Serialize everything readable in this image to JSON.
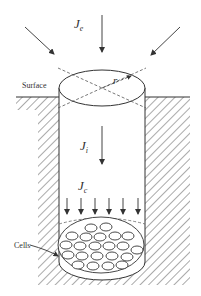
{
  "diagram": {
    "labels": {
      "je_main": "J",
      "je_sub": "e",
      "ji_main": "J",
      "ji_sub": "i",
      "jc_main": "J",
      "jc_sub": "c",
      "radius": "r",
      "surface": "Surface",
      "cells": "Cells"
    },
    "colors": {
      "stroke": "#333333",
      "hatch": "#555555",
      "background": "#ffffff"
    },
    "counts": {
      "inflow_arrows_bottom": 6,
      "incoming_external_arrows": 3
    }
  }
}
